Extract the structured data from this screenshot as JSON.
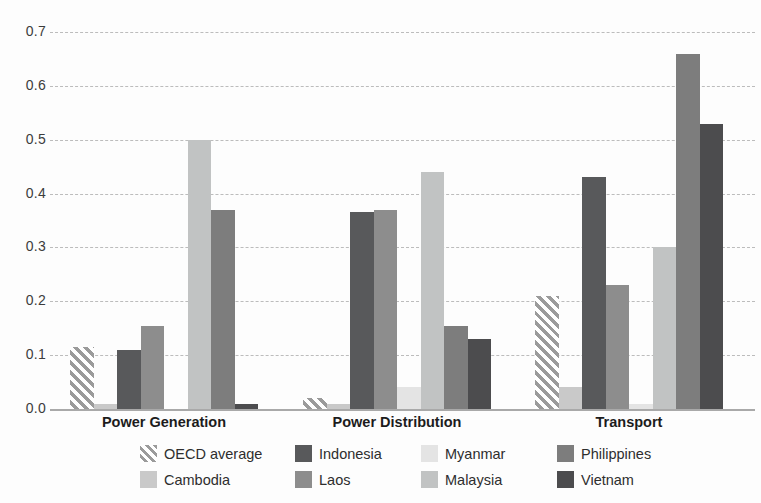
{
  "chart_data": {
    "type": "bar",
    "title": "",
    "xlabel": "",
    "ylabel": "",
    "categories": [
      "Power Generation",
      "Power Distribution",
      "Transport"
    ],
    "series": [
      {
        "name": "OECD average",
        "hatched": true,
        "color": "#ffffff",
        "hatch_color": "#9b9b9b",
        "values": [
          0.115,
          0.02,
          0.21
        ]
      },
      {
        "name": "Cambodia",
        "hatched": false,
        "color": "#c9c9c9",
        "values": [
          0.01,
          0.01,
          0.04
        ]
      },
      {
        "name": "Indonesia",
        "hatched": false,
        "color": "#58595b",
        "values": [
          0.11,
          0.365,
          0.43
        ]
      },
      {
        "name": "Laos",
        "hatched": false,
        "color": "#8d8d8d",
        "values": [
          0.155,
          0.37,
          0.23
        ]
      },
      {
        "name": "Myanmar",
        "hatched": false,
        "color": "#e4e4e4",
        "values": [
          0.0,
          0.04,
          0.01
        ]
      },
      {
        "name": "Malaysia",
        "hatched": false,
        "color": "#c1c3c3",
        "values": [
          0.5,
          0.44,
          0.3
        ]
      },
      {
        "name": "Philippines",
        "hatched": false,
        "color": "#7d7d7d",
        "values": [
          0.37,
          0.155,
          0.66
        ]
      },
      {
        "name": "Vietnam",
        "hatched": false,
        "color": "#4c4c4e",
        "values": [
          0.01,
          0.13,
          0.53
        ]
      }
    ],
    "ylim": [
      0,
      0.7
    ],
    "yticks": [
      "0.0",
      "0.1",
      "0.2",
      "0.3",
      "0.4",
      "0.5",
      "0.6",
      "0.7"
    ],
    "grid": true,
    "legend_position": "bottom",
    "legend_order": [
      "OECD average",
      "Indonesia",
      "Myanmar",
      "Philippines",
      "Cambodia",
      "Laos",
      "Malaysia",
      "Vietnam"
    ]
  }
}
